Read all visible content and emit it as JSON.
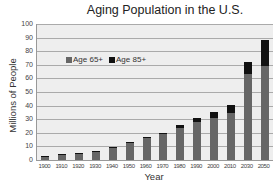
{
  "chart_data": {
    "type": "bar",
    "stacked": true,
    "title": "Aging Population in the U.S.",
    "xlabel": "Year",
    "ylabel": "Millions of People",
    "ylim": [
      0,
      100
    ],
    "yticks": [
      0,
      10,
      20,
      30,
      40,
      50,
      60,
      70,
      80,
      90,
      100
    ],
    "grid": true,
    "legend_position": "upper-left-inside",
    "categories": [
      "1900",
      "1910",
      "1920",
      "1930",
      "1940",
      "1950",
      "1960",
      "1970",
      "1980",
      "1990",
      "2000",
      "2010",
      "2030",
      "2050"
    ],
    "series": [
      {
        "name": "Age 65+",
        "color": "#666666",
        "values": [
          3.1,
          3.9,
          4.9,
          6.6,
          9.0,
          12.3,
          16.0,
          18.8,
          23.2,
          28.0,
          30.8,
          34.6,
          63,
          69
        ]
      },
      {
        "name": "Age 85+",
        "color": "#111111",
        "values": [
          0.1,
          0.2,
          0.2,
          0.3,
          0.4,
          0.6,
          0.9,
          1.4,
          2.2,
          3.1,
          4.2,
          5.5,
          9,
          19
        ]
      }
    ]
  },
  "legend": [
    {
      "label": "Age 65+",
      "color": "#666666"
    },
    {
      "label": "Age 85+",
      "color": "#111111"
    }
  ]
}
